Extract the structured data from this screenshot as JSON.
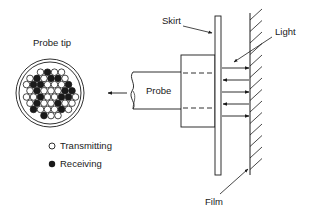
{
  "diagram": {
    "labels": {
      "probe_tip": "Probe tip",
      "probe": "Probe",
      "skirt": "Skirt",
      "light": "Light",
      "film": "Film"
    },
    "legend": [
      {
        "symbol": "open-circle",
        "label": "Transmitting"
      },
      {
        "symbol": "filled-circle",
        "label": "Receiving"
      }
    ],
    "colors": {
      "ink": "#1a1a1a",
      "background": "#ffffff"
    },
    "light_arrows": [
      {
        "direction": "right",
        "y": 68
      },
      {
        "direction": "left",
        "y": 80
      },
      {
        "direction": "right",
        "y": 92
      },
      {
        "direction": "left",
        "y": 104
      },
      {
        "direction": "right",
        "y": 116
      }
    ]
  }
}
